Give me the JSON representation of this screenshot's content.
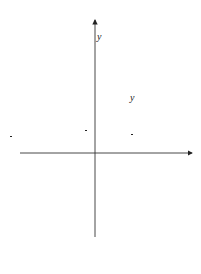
{
  "figure": {
    "caption_prefix": "图",
    "caption_number": "3-47",
    "axes": {
      "x_label": "x",
      "y_label": "y",
      "origin_label": "0"
    },
    "ticks": {
      "y_one": "1",
      "y_half_num": "1",
      "y_half_den": "2"
    },
    "curves": [
      {
        "name": "cosh",
        "style": "solid",
        "label_pre": "y = cosh",
        "label_var": "x"
      },
      {
        "name": "sinh",
        "style": "solid",
        "label_pre": "y = sinh",
        "label_var": "x"
      },
      {
        "name": "half_exp",
        "style": "dashed",
        "label_y": "y =",
        "frac_num": "1",
        "frac_den": "2",
        "label_e": "e",
        "label_exp": "x"
      },
      {
        "name": "half_exp_neg",
        "style": "dashed",
        "label_y": "y =",
        "frac_num": "1",
        "frac_den": "2",
        "label_e": "e",
        "label_exp": "−x"
      }
    ]
  },
  "chart_data": {
    "type": "line",
    "title": "",
    "xlabel": "x",
    "ylabel": "y",
    "series": [
      {
        "name": "y = cosh x",
        "style": "solid",
        "formula": "cosh(x)"
      },
      {
        "name": "y = sinh x",
        "style": "solid",
        "formula": "sinh(x)"
      },
      {
        "name": "y = 1/2 e^x",
        "style": "dashed",
        "formula": "0.5*exp(x)"
      },
      {
        "name": "y = 1/2 e^-x",
        "style": "dashed",
        "formula": "0.5*exp(-x)"
      }
    ],
    "annotations": [
      "1",
      "1/2",
      "0"
    ],
    "xlim": [
      -2.3,
      3.0
    ],
    "ylim": [
      -1.4,
      2.1
    ],
    "grid": false,
    "caption": "图 3-47"
  }
}
